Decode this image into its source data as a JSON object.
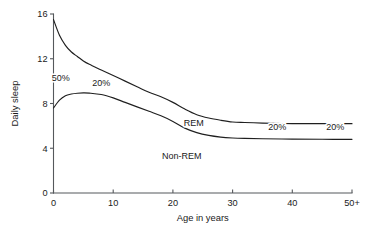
{
  "chart_data": {
    "type": "line",
    "title": "",
    "xlabel": "Age in years",
    "ylabel": "Daily sleep",
    "xlim": [
      0,
      50
    ],
    "ylim": [
      0,
      16
    ],
    "grid": false,
    "legend_position": "none",
    "x_ticks": [
      "0",
      "10",
      "20",
      "30",
      "40",
      "50+"
    ],
    "x_tick_values": [
      0,
      10,
      20,
      30,
      40,
      50
    ],
    "y_ticks": [
      "0",
      "4",
      "8",
      "12",
      "16"
    ],
    "y_tick_values": [
      0,
      4,
      8,
      12,
      16
    ],
    "x": [
      0,
      1,
      2,
      3,
      4,
      5,
      6,
      8,
      10,
      12,
      14,
      16,
      18,
      20,
      22,
      24,
      26,
      28,
      30,
      32,
      35,
      40,
      45,
      50
    ],
    "series": [
      {
        "name": "Total sleep",
        "description": "Upper curve: total daily sleep (REM + Non-REM)",
        "values": [
          15.5,
          14.1,
          13.2,
          12.6,
          12.2,
          11.8,
          11.5,
          11.0,
          10.5,
          10.0,
          9.5,
          9.0,
          8.6,
          8.1,
          7.5,
          7.0,
          6.7,
          6.5,
          6.35,
          6.3,
          6.25,
          6.2,
          6.2,
          6.2
        ]
      },
      {
        "name": "Non-REM sleep",
        "description": "Lower curve: Non-REM daily sleep; area below is Non-REM, area between curves is REM",
        "values": [
          7.6,
          8.3,
          8.7,
          8.85,
          8.92,
          8.95,
          8.93,
          8.8,
          8.5,
          8.1,
          7.7,
          7.3,
          6.9,
          6.4,
          5.8,
          5.4,
          5.15,
          5.0,
          4.92,
          4.88,
          4.85,
          4.82,
          4.8,
          4.8
        ]
      }
    ],
    "annotations": [
      {
        "text": "50%",
        "x_value": 1.2,
        "y_value": 10.0,
        "name": "rem-fraction-newborn"
      },
      {
        "text": "20%",
        "x_value": 8.0,
        "y_value": 9.6,
        "name": "rem-fraction-childhood"
      },
      {
        "text": "REM",
        "x_value": 23.5,
        "y_value": 6.0,
        "name": "rem-region-label"
      },
      {
        "text": "20%",
        "x_value": 37.5,
        "y_value": 5.6,
        "name": "rem-fraction-adult"
      },
      {
        "text": "20%",
        "x_value": 47.2,
        "y_value": 5.6,
        "name": "rem-fraction-older-adult"
      },
      {
        "text": "Non-REM",
        "x_value": 21.5,
        "y_value": 3.0,
        "name": "non-rem-region-label"
      }
    ]
  },
  "colors": {
    "curve": "#1f1f1f",
    "axis": "#55585c",
    "text": "#1a1a1a",
    "background": "#ffffff"
  }
}
